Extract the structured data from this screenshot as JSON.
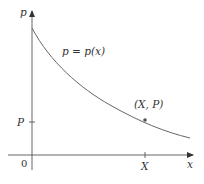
{
  "diagram": {
    "y_axis_label": "p",
    "x_axis_label": "x",
    "origin_label": "0",
    "curve_label": "p = p(x)",
    "point_label": "(X, P)",
    "x_tick_label": "X",
    "y_tick_label": "P",
    "curve_type": "decreasing convex",
    "colors": {
      "axis": "#555555",
      "curve": "#666666",
      "text": "#333333"
    }
  }
}
